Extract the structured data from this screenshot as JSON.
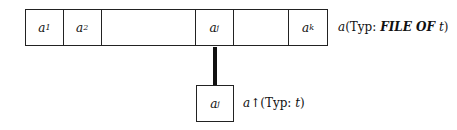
{
  "diagram": {
    "file_array": {
      "cells": [
        {
          "base": "a",
          "sub": "1",
          "width": 38
        },
        {
          "base": "a",
          "sub": "2",
          "width": 38
        },
        {
          "base": "",
          "sub": "",
          "width": 95
        },
        {
          "base": "a",
          "sub": "j",
          "width": 38
        },
        {
          "base": "",
          "sub": "",
          "width": 56
        },
        {
          "base": "a",
          "sub": "k",
          "width": 38
        }
      ],
      "label": {
        "var": "a",
        "prefix": "(Typ: ",
        "keyword": "FILE OF",
        "type_var": "t",
        "suffix": ")"
      }
    },
    "buffer": {
      "cell": {
        "base": "a",
        "sub": "j"
      },
      "label": {
        "var": "a",
        "arrow": "↑",
        "prefix": "(Typ: ",
        "type_var": "t",
        "suffix": ")"
      }
    },
    "connector": {
      "color": "#111111"
    }
  }
}
